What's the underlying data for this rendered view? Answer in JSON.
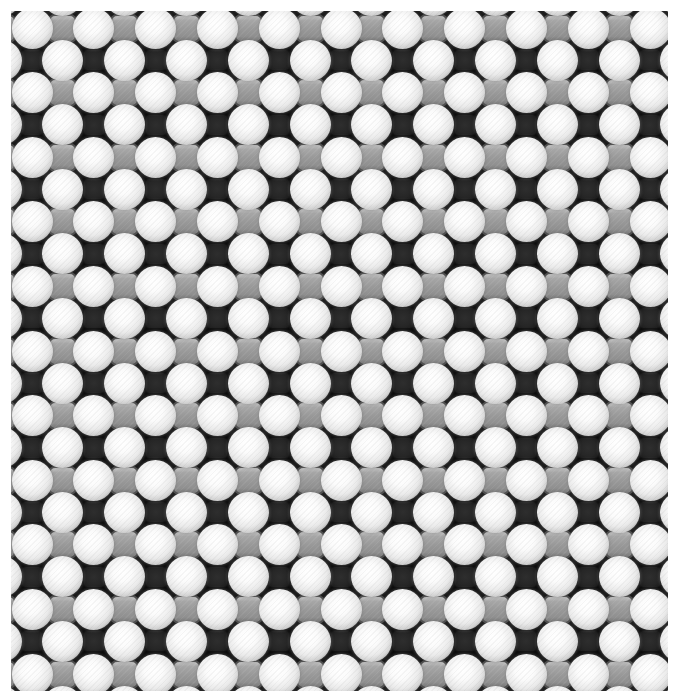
{
  "image": {
    "description": "Atomic-resolution lattice image: alternating rows of large bright atoms with medium gray square sites, and rows of large bright atoms with dark square vacancies",
    "background_color": "#ffffff",
    "frame": {
      "left": 11,
      "top": 11,
      "width": 657,
      "height": 680,
      "fill": "#0c0c0c"
    }
  },
  "lattice": {
    "period_x": 61.8,
    "period_y": 64.6,
    "row_a": {
      "first_y": 28,
      "rows": [
        -1,
        0,
        1,
        2,
        3,
        4,
        5,
        6,
        7,
        8,
        9,
        10,
        11
      ],
      "sites": [
        {
          "kind": "large",
          "first_x": 32,
          "count": 12,
          "color": "#f2f2f2"
        },
        {
          "kind": "medium",
          "first_x": 1,
          "count": 12,
          "color": "#999999"
        }
      ]
    },
    "row_b": {
      "first_y": 60,
      "rows": [
        -1,
        0,
        1,
        2,
        3,
        4,
        5,
        6,
        7,
        8,
        9,
        10
      ],
      "sites": [
        {
          "kind": "large",
          "first_x": 1,
          "count": 12,
          "color": "#f2f2f2"
        },
        {
          "kind": "small",
          "first_x": 32,
          "count": 12,
          "color": "#262626"
        }
      ]
    },
    "sizes": {
      "large": 41,
      "medium": 29,
      "small": 22
    }
  }
}
